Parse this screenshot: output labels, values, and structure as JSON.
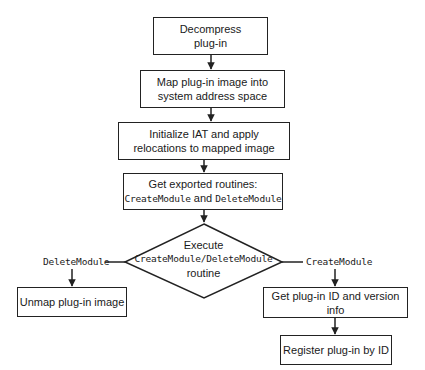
{
  "diagram": {
    "type": "flowchart",
    "nodes": {
      "decompress": {
        "line1": "Decompress",
        "line2": "plug-in"
      },
      "map": {
        "line1": "Map plug-in image into",
        "line2": "system address space"
      },
      "initialize": {
        "line1": "Initialize IAT and apply",
        "line2": "relocations to mapped image"
      },
      "get_exported": {
        "line1": "Get exported routines:",
        "code1": "CreateModule",
        "joiner": " and ",
        "code2": "DeleteModule"
      },
      "execute": {
        "line1": "Execute",
        "code": "CreateModule/DeleteModule",
        "line3": "routine"
      },
      "unmap": {
        "label": "Unmap plug-in image"
      },
      "get_id": {
        "label": "Get plug-in ID and version info"
      },
      "register": {
        "label": "Register plug-in by ID"
      }
    },
    "branches": {
      "left": "DeleteModule",
      "right": "CreateModule"
    },
    "edges": [
      {
        "from": "decompress",
        "to": "map"
      },
      {
        "from": "map",
        "to": "initialize"
      },
      {
        "from": "initialize",
        "to": "get_exported"
      },
      {
        "from": "get_exported",
        "to": "execute"
      },
      {
        "from": "execute",
        "to": "unmap",
        "label": "DeleteModule"
      },
      {
        "from": "execute",
        "to": "get_id",
        "label": "CreateModule"
      },
      {
        "from": "get_id",
        "to": "register"
      }
    ]
  }
}
